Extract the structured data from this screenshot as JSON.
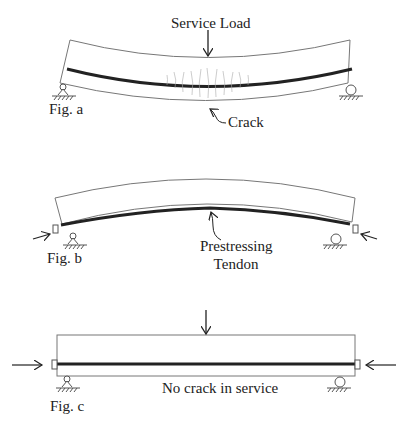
{
  "figures": {
    "a": {
      "caption": "Fig. a",
      "load_label": "Service Load",
      "crack_label": "Crack",
      "beam_shape": "sagging (concave up)"
    },
    "b": {
      "caption": "Fig. b",
      "tendon_label_line1": "Prestressing",
      "tendon_label_line2": "Tendon",
      "beam_shape": "hogging (camber upward)"
    },
    "c": {
      "caption": "Fig. c",
      "note": "No crack in service",
      "beam_shape": "straight"
    }
  },
  "colors": {
    "outline": "#777777",
    "tendon": "#222222",
    "crack": "#999999",
    "text": "#222222"
  }
}
